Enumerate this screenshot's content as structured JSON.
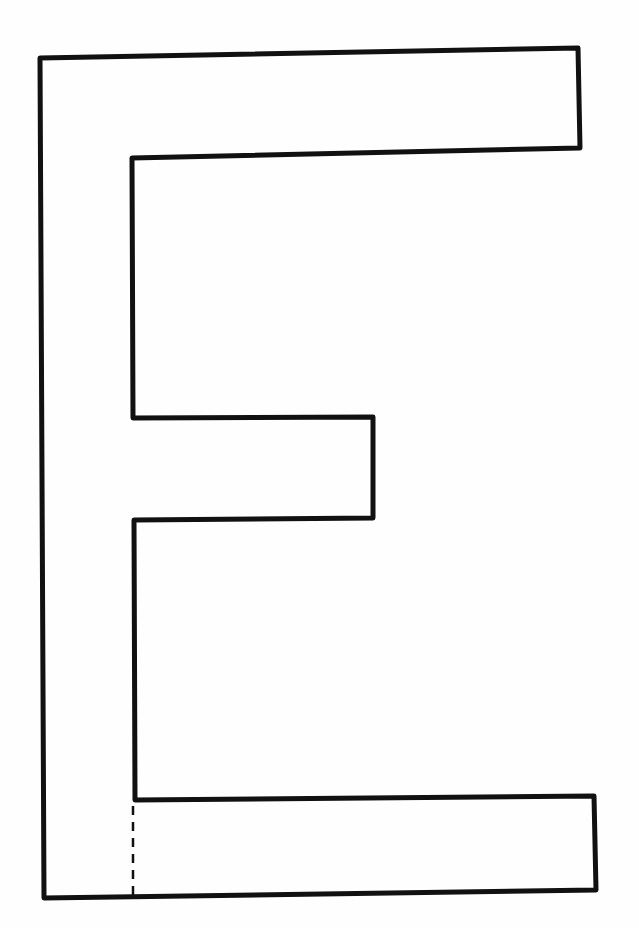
{
  "figure": {
    "letter": "E",
    "background_color": "#fefefe",
    "stroke_color": "#111111",
    "stroke_width": 5,
    "outline_points": [
      [
        40,
        58
      ],
      [
        578,
        48
      ],
      [
        580,
        148
      ],
      [
        132,
        158
      ],
      [
        133,
        418
      ],
      [
        373,
        417
      ],
      [
        373,
        518
      ],
      [
        134,
        520
      ],
      [
        135,
        800
      ],
      [
        594,
        796
      ],
      [
        596,
        890
      ],
      [
        44,
        898
      ]
    ],
    "dashed_guide": {
      "from": [
        133,
        806
      ],
      "to": [
        133,
        895
      ],
      "stroke_width": 2.5,
      "dash": "9 7"
    }
  }
}
